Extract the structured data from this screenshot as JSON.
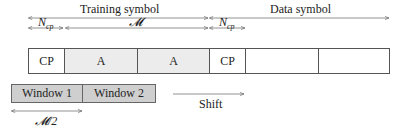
{
  "diagram": {
    "top_labels": {
      "training_symbol": "Training symbol",
      "data_symbol": "Data symbol"
    },
    "span_labels": {
      "ncp_training": {
        "base": "N",
        "sub": "cp"
      },
      "m": "𝓜",
      "ncp_data": {
        "base": "N",
        "sub": "cp"
      }
    },
    "symbol_cells": [
      {
        "label": "CP",
        "fill": "#ffffff"
      },
      {
        "label": "A",
        "fill": "#ececec"
      },
      {
        "label": "A",
        "fill": "#ececec"
      },
      {
        "label": "CP",
        "fill": "#ffffff"
      },
      {
        "label": "",
        "fill": "#ffffff"
      },
      {
        "label": "",
        "fill": "#ffffff"
      }
    ],
    "windows": [
      {
        "label": "Window 1"
      },
      {
        "label": "Window 2"
      }
    ],
    "half_span_label": "𝓜/2",
    "shift_label": "Shift",
    "colors": {
      "line": "#555555",
      "window_fill": "#cfcfcf",
      "a_fill": "#ececec"
    }
  }
}
